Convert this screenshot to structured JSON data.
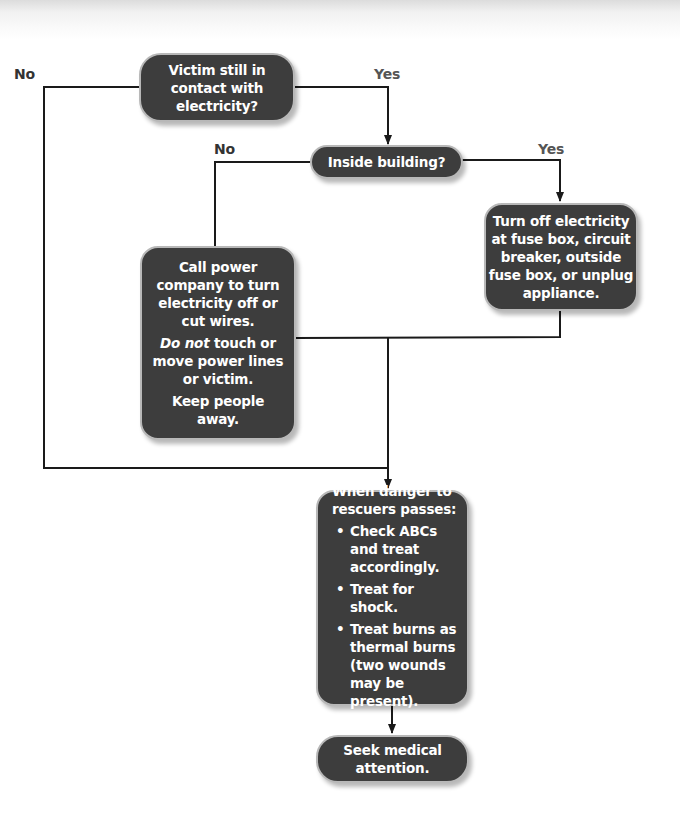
{
  "diagram": {
    "type": "flowchart",
    "colors": {
      "box_fill": "#3d3d3d",
      "box_border": "#b8b8b8",
      "text": "#ffffff",
      "line": "#1a1a1a"
    },
    "nodes": {
      "victim_contact": {
        "lines": [
          "Victim still in",
          "contact with",
          "electricity?"
        ]
      },
      "inside_building": {
        "text": "Inside building?"
      },
      "turn_off": {
        "lines": [
          "Turn off electricity",
          "at fuse box, circuit",
          "breaker, outside",
          "fuse box, or unplug",
          "appliance."
        ]
      },
      "call_power": {
        "para1": [
          "Call power",
          "company to turn",
          "electricity off or",
          "cut wires."
        ],
        "para2_em": "Do not",
        "para2_rest": " touch or",
        "para2_lines": [
          "move power lines",
          "or victim."
        ],
        "para3": [
          "Keep people",
          "away."
        ]
      },
      "when_danger": {
        "heading": [
          "When danger to",
          "rescuers passes:"
        ],
        "bullets": [
          "Check ABCs and treat accordingly.",
          "Treat for shock.",
          "Treat burns as thermal burns (two wounds may be present)."
        ]
      },
      "seek_medical": {
        "lines": [
          "Seek medical",
          "attention."
        ]
      }
    },
    "edge_labels": {
      "victim_no": "No",
      "victim_yes": "Yes",
      "building_no": "No",
      "building_yes": "Yes"
    }
  }
}
